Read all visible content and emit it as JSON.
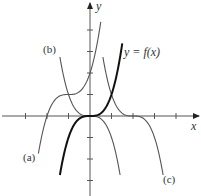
{
  "figure": {
    "axes": {
      "x_label": "x",
      "y_label": "y",
      "origin_px": [
        90,
        116
      ],
      "unit_px": 21.5,
      "x_ticks": [
        -3,
        -2,
        -1,
        1,
        2,
        3,
        4
      ],
      "y_ticks": [
        -3,
        -2,
        -1,
        1,
        2,
        3,
        4
      ]
    },
    "curves": [
      {
        "id": "f",
        "label": "y = f(x)",
        "expression": "x^3",
        "color": "#111111",
        "weight": "bold",
        "x_range": [
          -1.4,
          1.5
        ]
      },
      {
        "id": "a",
        "label": "(a)",
        "expression": "f(x+1)+1",
        "color": "#555555",
        "weight": "normal",
        "x_range": [
          -2.4,
          0.5
        ]
      },
      {
        "id": "b",
        "label": "(b)",
        "expression": "-f(x)",
        "color": "#555555",
        "weight": "normal",
        "x_range": [
          -1.4,
          1.4
        ]
      },
      {
        "id": "c",
        "label": "(c)",
        "expression": "-f(x-2)",
        "color": "#555555",
        "weight": "normal",
        "x_range": [
          0.6,
          3.4
        ]
      }
    ]
  }
}
